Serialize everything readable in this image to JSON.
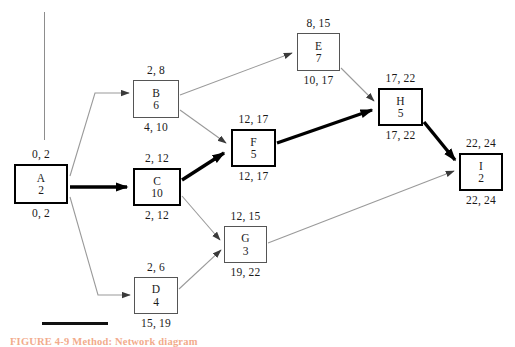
{
  "diagram": {
    "nodes": [
      {
        "key": "A",
        "id": "A",
        "duration": "2",
        "top_label": "0, 2",
        "bottom_label": "0, 2",
        "critical": true,
        "x": 14,
        "y": 164,
        "w": 54,
        "h": 40
      },
      {
        "key": "B",
        "id": "B",
        "duration": "6",
        "top_label": "2, 8",
        "bottom_label": "4, 10",
        "critical": false,
        "x": 133,
        "y": 80,
        "w": 46,
        "h": 38
      },
      {
        "key": "C",
        "id": "C",
        "duration": "10",
        "top_label": "2, 12",
        "bottom_label": "2, 12",
        "critical": true,
        "x": 133,
        "y": 168,
        "w": 48,
        "h": 38
      },
      {
        "key": "D",
        "id": "D",
        "duration": "4",
        "top_label": "2, 6",
        "bottom_label": "15, 19",
        "critical": false,
        "x": 134,
        "y": 277,
        "w": 44,
        "h": 37
      },
      {
        "key": "E",
        "id": "E",
        "duration": "7",
        "top_label": "8, 15",
        "bottom_label": "10, 17",
        "critical": false,
        "x": 297,
        "y": 33,
        "w": 43,
        "h": 38
      },
      {
        "key": "F",
        "id": "F",
        "duration": "5",
        "top_label": "12, 17",
        "bottom_label": "12, 17",
        "critical": true,
        "x": 231,
        "y": 129,
        "w": 45,
        "h": 38
      },
      {
        "key": "G",
        "id": "G",
        "duration": "3",
        "top_label": "12, 15",
        "bottom_label": "19, 22",
        "critical": false,
        "x": 224,
        "y": 226,
        "w": 43,
        "h": 37
      },
      {
        "key": "H",
        "id": "H",
        "duration": "5",
        "top_label": "17, 22",
        "bottom_label": "17, 22",
        "critical": true,
        "x": 378,
        "y": 88,
        "w": 45,
        "h": 38
      },
      {
        "key": "I",
        "id": "I",
        "duration": "2",
        "top_label": "22, 24",
        "bottom_label": "22, 24",
        "critical": true,
        "x": 459,
        "y": 153,
        "w": 44,
        "h": 38
      }
    ],
    "edges": [
      {
        "from": "A",
        "to": "B",
        "critical": false
      },
      {
        "from": "A",
        "to": "C",
        "critical": true
      },
      {
        "from": "A",
        "to": "D",
        "critical": false
      },
      {
        "from": "B",
        "to": "E",
        "critical": false
      },
      {
        "from": "B",
        "to": "F",
        "critical": false
      },
      {
        "from": "C",
        "to": "F",
        "critical": true
      },
      {
        "from": "C",
        "to": "G",
        "critical": false
      },
      {
        "from": "D",
        "to": "G",
        "critical": false
      },
      {
        "from": "E",
        "to": "H",
        "critical": false
      },
      {
        "from": "F",
        "to": "H",
        "critical": true
      },
      {
        "from": "G",
        "to": "I",
        "critical": false
      },
      {
        "from": "H",
        "to": "I",
        "critical": true
      }
    ],
    "caption": "FIGURE 4-9   Method: Network diagram",
    "colors": {
      "critical_path": "#000000",
      "normal_edge": "#9a9a9a",
      "node_border": "#555555",
      "caption": "#e8672c"
    }
  }
}
